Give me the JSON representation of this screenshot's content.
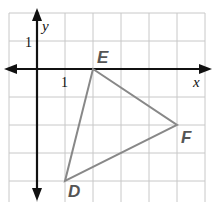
{
  "diagram": {
    "type": "coordinate-plane-triangle",
    "grid": {
      "x_min": -1,
      "x_max": 6,
      "y_min": -5,
      "y_max": 2,
      "unit_px": 28,
      "origin_px": [
        37,
        69
      ],
      "color": "#c8c8c8"
    },
    "axes": {
      "x_label": "x",
      "y_label": "y",
      "x_tick_label": "1",
      "y_tick_label": "1",
      "color": "#111111"
    },
    "triangle": {
      "color": "#888888",
      "vertices": [
        {
          "name": "E",
          "x": 2,
          "y": 0
        },
        {
          "name": "F",
          "x": 5,
          "y": -2
        },
        {
          "name": "D",
          "x": 1,
          "y": -4
        }
      ]
    },
    "label_color": "#555555"
  }
}
